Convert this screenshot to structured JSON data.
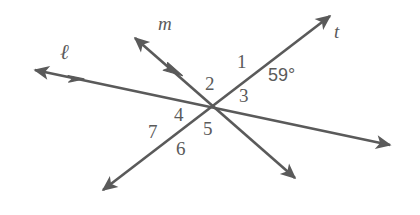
{
  "figure": {
    "stroke_color": "#5a5a5a",
    "text_color": "#5a5a5a",
    "background_color": "#ffffff",
    "stroke_width": 2.6
  },
  "lines": [
    {
      "id": "line-l",
      "label": "ℓ",
      "label_x": 60,
      "label_y": 46,
      "note": "upper parallel line, passes through intersection 1",
      "x1": 35,
      "y1": 70,
      "x2": 390,
      "y2": 145,
      "arrow_start": true,
      "arrow_end": true,
      "tick_arrow": {
        "x": 80,
        "y": 79,
        "count": 1
      }
    },
    {
      "id": "line-m",
      "label": "m",
      "label_x": 158,
      "label_y": 16,
      "note": "lower parallel line, passes through intersection 2",
      "x1": 135,
      "y1": 38,
      "x2": 295,
      "y2": 178,
      "arrow_start": true,
      "arrow_end": true,
      "tick_arrow": {
        "x": 178,
        "y": 75,
        "count": 1
      }
    },
    {
      "id": "line-t",
      "label": "t",
      "label_x": 334,
      "label_y": 24,
      "note": "transversal crossing both parallel lines",
      "x1": 330,
      "y1": 16,
      "x2": 103,
      "y2": 190,
      "arrow_start": true,
      "arrow_end": true,
      "tick_arrow": null
    }
  ],
  "intersections": [
    {
      "id": "intersection-upper",
      "x": 245,
      "y": 82
    },
    {
      "id": "intersection-lower",
      "x": 183,
      "y": 133
    }
  ],
  "angle_labels": [
    {
      "id": "angle-1",
      "text": "1",
      "x": 237,
      "y": 52
    },
    {
      "id": "angle-2",
      "text": "2",
      "x": 205,
      "y": 74
    },
    {
      "id": "angle-3",
      "text": "3",
      "x": 239,
      "y": 86
    },
    {
      "id": "angle-4",
      "text": "4",
      "x": 174,
      "y": 105
    },
    {
      "id": "angle-5",
      "text": "5",
      "x": 203,
      "y": 119
    },
    {
      "id": "angle-6",
      "text": "6",
      "x": 176,
      "y": 139
    },
    {
      "id": "angle-7",
      "text": "7",
      "x": 148,
      "y": 122
    }
  ],
  "angle_measures": [
    {
      "id": "angle-measure-59",
      "text": "59°",
      "x": 268,
      "y": 66
    }
  ]
}
